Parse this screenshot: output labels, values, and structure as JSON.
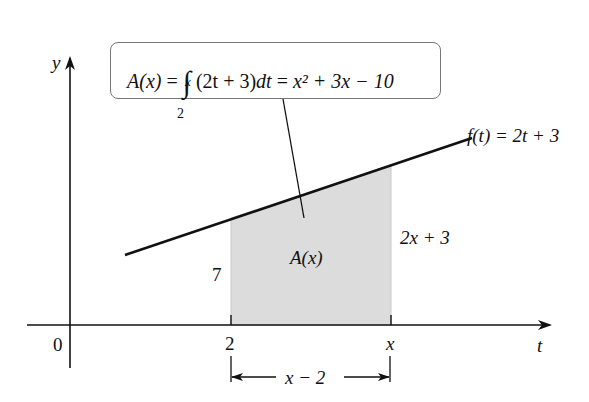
{
  "figure": {
    "formula": {
      "lhs": "A(x)",
      "eq1": "=",
      "integral_upper": "x",
      "integral_lower": "2",
      "integrand": "(2t + 3)",
      "differential": "dt",
      "eq2": "=",
      "result": "x² + 3x − 10"
    },
    "function_label": "f(t) = 2t + 3",
    "axis_labels": {
      "y": "y",
      "t": "t"
    },
    "tick_labels": {
      "origin": "0",
      "a": "2",
      "x": "x"
    },
    "heights": {
      "left": "7",
      "right": "2x + 3"
    },
    "region_label": "A(x)",
    "width_label": "x − 2",
    "colors": {
      "shade": "#dcdcdc",
      "line": "#111111",
      "box_border": "#777777"
    }
  }
}
